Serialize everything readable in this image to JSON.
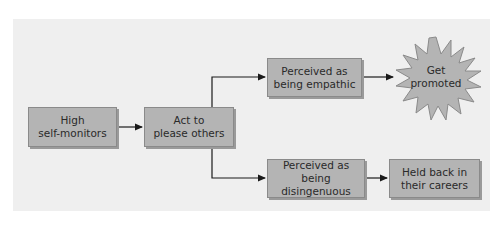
{
  "diagram": {
    "type": "flowchart",
    "nodes": {
      "high_self_monitors": {
        "line1": "High",
        "line2": "self-monitors"
      },
      "act_to_please": {
        "line1": "Act to",
        "line2": "please others"
      },
      "perceived_empathic": {
        "line1": "Perceived as",
        "line2": "being empathic"
      },
      "get_promoted": {
        "line1": "Get",
        "line2": "promoted"
      },
      "perceived_disingenuous": {
        "line1": "Perceived as",
        "line2": "being disingenuous"
      },
      "held_back": {
        "line1": "Held back in",
        "line2": "their careers"
      }
    },
    "edges": [
      {
        "from": "high_self_monitors",
        "to": "act_to_please"
      },
      {
        "from": "act_to_please",
        "to": "perceived_empathic"
      },
      {
        "from": "act_to_please",
        "to": "perceived_disingenuous"
      },
      {
        "from": "perceived_empathic",
        "to": "get_promoted"
      },
      {
        "from": "perceived_disingenuous",
        "to": "held_back"
      }
    ],
    "colors": {
      "background": "#efefef",
      "box_fill": "#b4b4b4",
      "box_border": "#8a8a8a",
      "line": "#1a1a1a",
      "text": "#2a2a2a"
    }
  }
}
